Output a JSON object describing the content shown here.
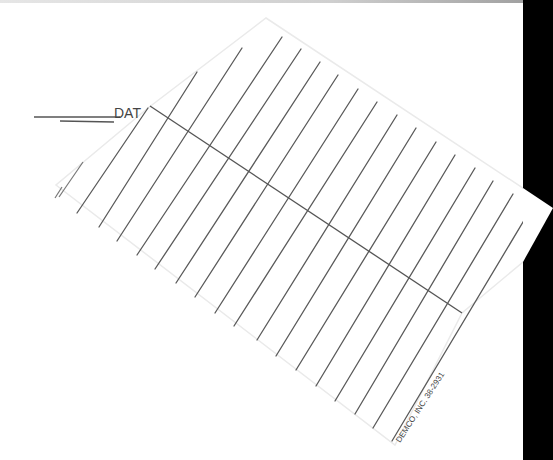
{
  "document": {
    "type": "library date due slip (scanned, rotated)",
    "header_label": "DATE DUE",
    "visible_header_text": "DAT",
    "ruled_line_count": 17,
    "printer_imprint": "DEMCO, INC. 38-2931",
    "colors": {
      "paper": "#ffffff",
      "ink": "#555555",
      "background_edge": "#000000"
    }
  }
}
